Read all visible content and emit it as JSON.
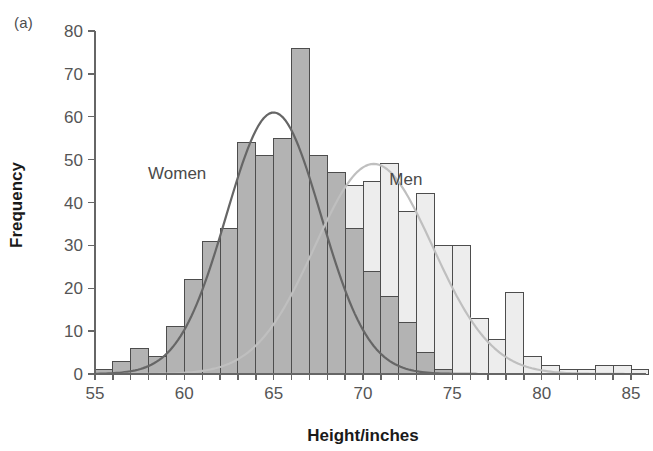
{
  "figure": {
    "panel_label": "(a)"
  },
  "chart_data": {
    "type": "bar",
    "title": "",
    "subtitle": "",
    "xlabel": "Height/inches",
    "ylabel": "Frequency",
    "xlim": [
      55,
      85.5
    ],
    "ylim": [
      0,
      80
    ],
    "xticks": [
      55,
      60,
      65,
      70,
      75,
      80,
      85
    ],
    "xtick_labels": [
      "55",
      "60",
      "65",
      "70",
      "75",
      "80",
      "85"
    ],
    "minor_xtick_step": 1,
    "yticks": [
      0,
      10,
      20,
      30,
      40,
      50,
      60,
      70,
      80
    ],
    "ytick_labels": [
      "0",
      "10",
      "20",
      "30",
      "40",
      "50",
      "60",
      "70",
      "80"
    ],
    "grid": false,
    "legend_position": "inline-annotation",
    "bin_width": 1,
    "annotations": [
      {
        "text": "Women",
        "x": 59.6,
        "y": 45.5,
        "color": "#4a4a4a"
      },
      {
        "text": "Men",
        "x": 72.4,
        "y": 44.0,
        "color": "#4a4a4a"
      }
    ],
    "series": [
      {
        "name": "Women",
        "type": "histogram",
        "fill": "#b3b3b3",
        "stroke": "#4d4d4d",
        "opacity": 1,
        "bins": [
          55,
          56,
          57,
          58,
          59,
          60,
          61,
          62,
          63,
          64,
          65,
          66,
          67,
          68,
          69,
          70,
          71,
          72,
          73,
          74
        ],
        "values": [
          1,
          3,
          6,
          4,
          11,
          22,
          31,
          34,
          54,
          51,
          55,
          76,
          51,
          47,
          34,
          24,
          18,
          12,
          5,
          1
        ]
      },
      {
        "name": "Men",
        "type": "histogram",
        "fill": "#ededed",
        "stroke": "#4d4d4d",
        "opacity": 1,
        "bins": [
          64,
          65,
          66,
          67,
          68,
          69,
          70,
          71,
          72,
          73,
          74,
          75,
          76,
          77,
          78,
          79,
          80,
          81,
          82,
          83,
          84,
          85
        ],
        "values": [
          1,
          2,
          5,
          11,
          23,
          44,
          45,
          49,
          38,
          42,
          30,
          30,
          13,
          8,
          19,
          4,
          2,
          1,
          1,
          2,
          2,
          1
        ]
      }
    ],
    "curves": [
      {
        "name": "Women normal fit",
        "color": "#666666",
        "mean": 65.0,
        "sd": 2.65,
        "peak": 61
      },
      {
        "name": "Men normal fit",
        "color": "#bfbfbf",
        "mean": 70.6,
        "sd": 3.3,
        "peak": 49
      }
    ]
  },
  "colors": {
    "women_fill": "#b3b3b3",
    "men_fill": "#ededed",
    "bar_stroke": "#4d4d4d",
    "axis": "#666666",
    "tick_text": "#555555",
    "axis_title": "#1a1a1a",
    "women_curve": "#666666",
    "men_curve": "#bfbfbf"
  }
}
